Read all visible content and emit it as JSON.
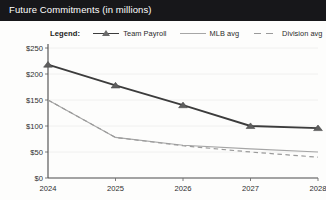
{
  "window": {
    "title": "Future Commitments (in millions)"
  },
  "legend": {
    "title": "Legend:",
    "items": [
      {
        "label": "Team Payroll",
        "icon": "line-with-triangle-marker-icon",
        "color": "#3c3c3c"
      },
      {
        "label": "MLB avg",
        "icon": "solid-line-icon",
        "color": "#a6a6a6"
      },
      {
        "label": "Division avg",
        "icon": "dashed-line-icon",
        "color": "#9a9a9a"
      }
    ]
  },
  "chart_data": {
    "type": "line",
    "title": "Future Commitments (in millions)",
    "xlabel": "",
    "ylabel": "",
    "x": [
      "2024",
      "2025",
      "2026",
      "2027",
      "2028"
    ],
    "categories": [
      "2024",
      "2025",
      "2026",
      "2027",
      "2028"
    ],
    "series": [
      {
        "name": "Team Payroll",
        "values": [
          218,
          178,
          140,
          100,
          96
        ],
        "color": "#3c3c3c",
        "style": "solid",
        "marker": "triangle"
      },
      {
        "name": "MLB avg",
        "values": [
          150,
          78,
          63,
          56,
          50
        ],
        "color": "#a6a6a6",
        "style": "solid",
        "marker": "none"
      },
      {
        "name": "Division avg",
        "values": [
          150,
          78,
          62,
          50,
          40
        ],
        "color": "#9a9a9a",
        "style": "dashed",
        "marker": "none"
      }
    ],
    "ylim": [
      0,
      250
    ],
    "yticks": [
      0,
      50,
      100,
      150,
      200,
      250
    ],
    "yticklabels": [
      "$0",
      "$50",
      "$100",
      "$150",
      "$200",
      "$250"
    ],
    "xticklabels": [
      "2024",
      "2025",
      "2026",
      "2027",
      "2028"
    ],
    "grid": true,
    "grid_axis": "y",
    "legend_position": "above-plot"
  }
}
